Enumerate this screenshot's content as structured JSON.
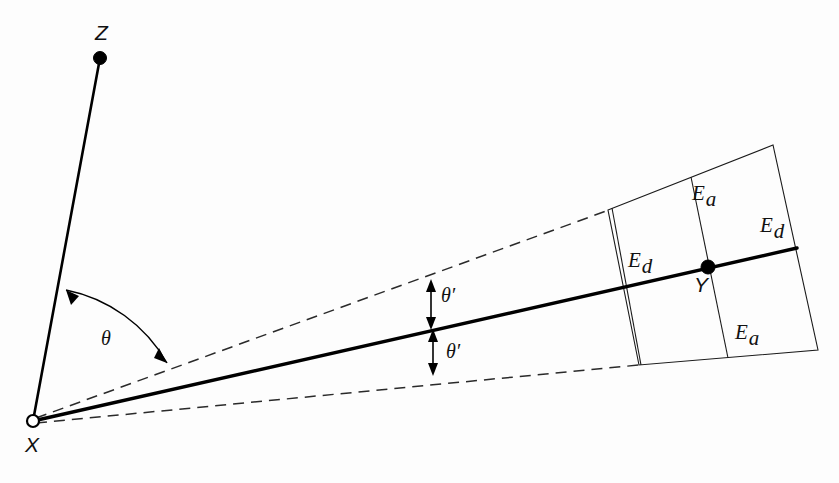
{
  "figure": {
    "type": "geometry-diagram",
    "background_color": "#fdfdfd",
    "stroke_color": "#000000"
  },
  "points": {
    "z": {
      "label": "Z",
      "x": 100,
      "y": 58,
      "label_x": 95,
      "label_y": 40,
      "style": "filled-dot"
    },
    "x": {
      "label": "X",
      "x": 33,
      "y": 421,
      "label_x": 25,
      "label_y": 452,
      "style": "open-circle"
    },
    "y": {
      "label": "Y",
      "x": 708,
      "y": 267,
      "label_x": 694,
      "label_y": 292,
      "style": "filled-dot"
    }
  },
  "angles": {
    "theta": {
      "label": "θ",
      "label_x": 101,
      "label_y": 345
    },
    "theta_prime_upper": {
      "label": "θ′",
      "label_x": 441,
      "label_y": 302
    },
    "theta_prime_lower": {
      "label": "θ′",
      "label_x": 446,
      "label_y": 358
    }
  },
  "error_labels": [
    {
      "label": "E",
      "sub": "a",
      "x": 692,
      "y": 200,
      "name": "error-label-ea-upper"
    },
    {
      "label": "E",
      "sub": "d",
      "x": 628,
      "y": 267,
      "name": "error-label-ed-left"
    },
    {
      "label": "E",
      "sub": "d",
      "x": 760,
      "y": 232,
      "name": "error-label-ed-right"
    },
    {
      "label": "E",
      "sub": "a",
      "x": 735,
      "y": 339,
      "name": "error-label-ea-lower"
    }
  ],
  "lines": {
    "xz": {
      "name": "line-x-to-z",
      "x1": 33,
      "y1": 421,
      "x2": 100,
      "y2": 58,
      "weight": "medium"
    },
    "xy": {
      "name": "line-x-to-y-sightline",
      "x1": 33,
      "y1": 421,
      "x2": 797,
      "y2": 248,
      "weight": "thick"
    },
    "dashed_upper": {
      "name": "dashed-upper-bound",
      "x1": 36,
      "y1": 418,
      "x2": 609,
      "y2": 210
    },
    "dashed_lower": {
      "name": "dashed-lower-bound",
      "x1": 36,
      "y1": 423,
      "x2": 639,
      "y2": 365
    }
  },
  "grid": {
    "name": "error-quadrilateral",
    "top_left": {
      "x": 608,
      "y": 210
    },
    "top_right": {
      "x": 773,
      "y": 145
    },
    "bottom_right": {
      "x": 818,
      "y": 350
    },
    "bottom_left": {
      "x": 639,
      "y": 365
    },
    "vertical_dividers": [
      {
        "x1": 612,
        "y1": 208,
        "x2": 641,
        "y2": 365
      },
      {
        "x1": 691,
        "y1": 177,
        "x2": 728,
        "y2": 358
      }
    ]
  }
}
